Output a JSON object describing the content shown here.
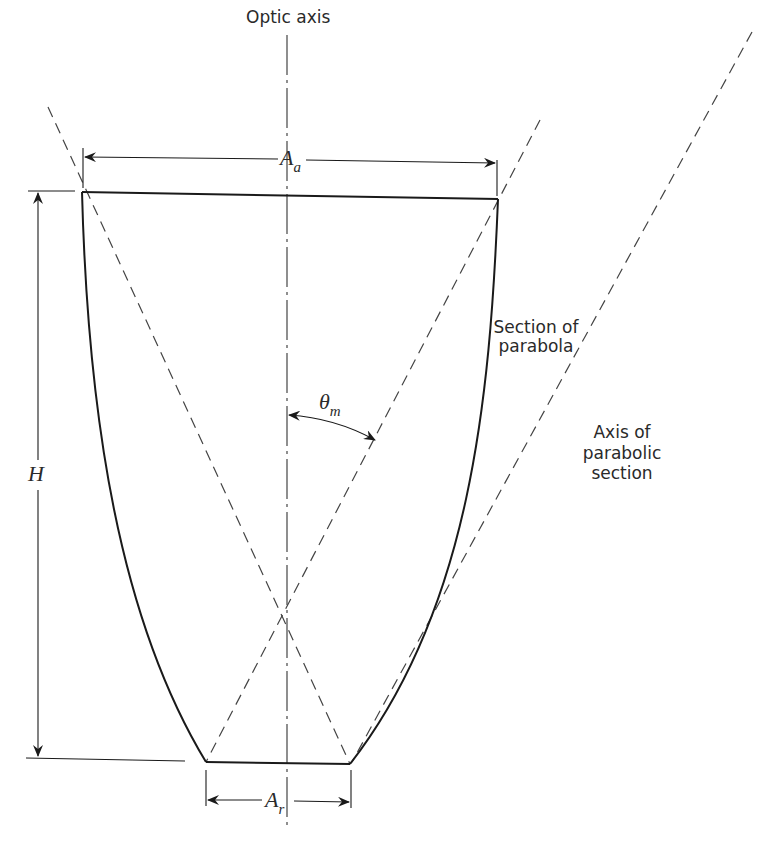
{
  "diagram": {
    "type": "compound-parabolic-concentrator cross-section",
    "labels": {
      "optic_axis": "Optic axis",
      "entrance_aperture": {
        "main": "A",
        "sub": "a"
      },
      "exit_aperture": {
        "main": "A",
        "sub": "r"
      },
      "height": "H",
      "angle": {
        "main": "θ",
        "sub": "m"
      },
      "section_of_parabola": [
        "Section of",
        "parabola"
      ],
      "axis_of_parabolic_section": [
        "Axis of",
        "parabolic",
        "section"
      ]
    },
    "colors": {
      "line": "#1a1a1a",
      "dashed": "#444444",
      "text": "#2a2a2a",
      "background": "#ffffff"
    }
  }
}
